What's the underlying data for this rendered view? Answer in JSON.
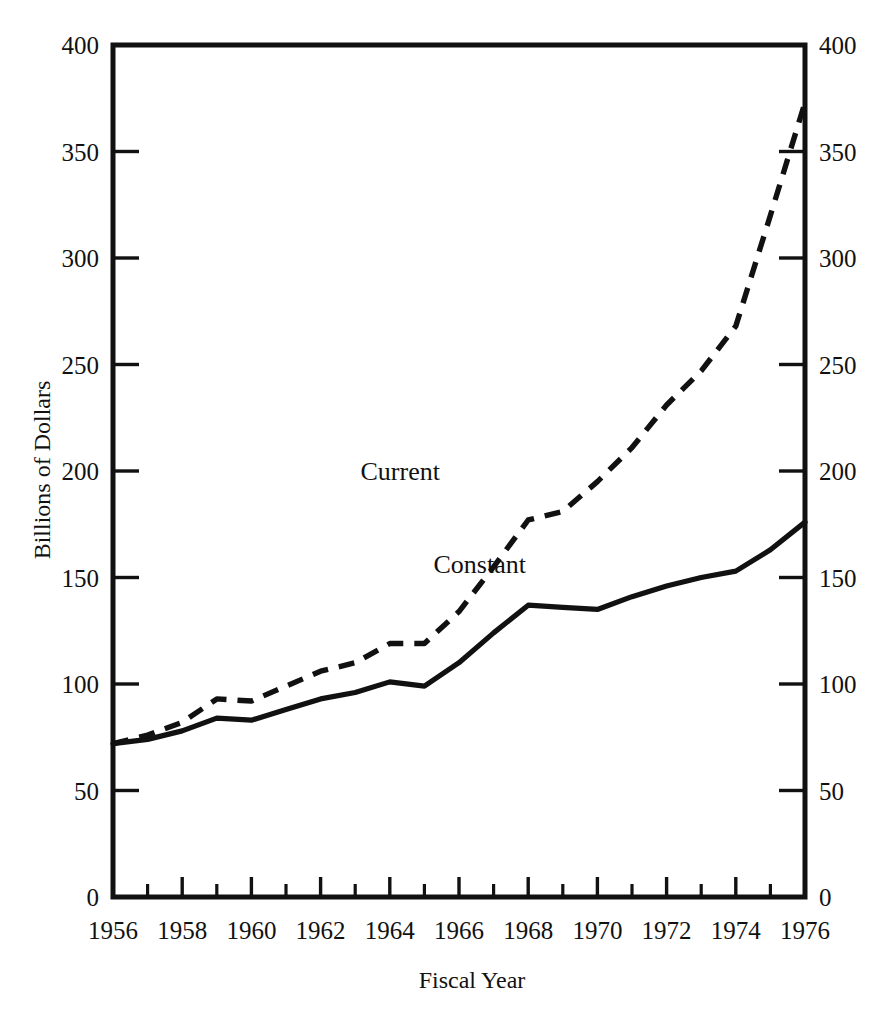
{
  "chart_data": {
    "type": "line",
    "title": "",
    "xlabel": "Fiscal Year",
    "ylabel": "Billions of Dollars",
    "xlim": [
      1956,
      1976
    ],
    "ylim": [
      0,
      400
    ],
    "grid": false,
    "legend": "inline-labels",
    "x_tick_labels": [
      "1956",
      "1958",
      "1960",
      "1962",
      "1964",
      "1966",
      "1968",
      "1970",
      "1972",
      "1974",
      "1976"
    ],
    "x_tick_values": [
      1956,
      1958,
      1960,
      1962,
      1964,
      1966,
      1968,
      1970,
      1972,
      1974,
      1976
    ],
    "x_minor_ticks": [
      1957,
      1959,
      1961,
      1963,
      1965,
      1967,
      1969,
      1971,
      1973,
      1975
    ],
    "y_tick_labels_left": [
      "0",
      "50",
      "100",
      "150",
      "200",
      "250",
      "300",
      "350",
      "400"
    ],
    "y_tick_labels_right": [
      "0",
      "50",
      "100",
      "150",
      "200",
      "250",
      "300",
      "350",
      "400"
    ],
    "y_tick_values": [
      0,
      50,
      100,
      150,
      200,
      250,
      300,
      350,
      400
    ],
    "x": [
      1956,
      1957,
      1958,
      1959,
      1960,
      1961,
      1962,
      1963,
      1964,
      1965,
      1966,
      1967,
      1968,
      1969,
      1970,
      1971,
      1972,
      1973,
      1974,
      1975,
      1976
    ],
    "series": [
      {
        "name": "Current",
        "style": "dashed",
        "label_text": "Current",
        "values": [
          72,
          76,
          82,
          93,
          92,
          99,
          106,
          110,
          119,
          119,
          134,
          155,
          177,
          181,
          195,
          211,
          231,
          247,
          268,
          320,
          373
        ]
      },
      {
        "name": "Constant",
        "style": "solid",
        "label_text": "Constant",
        "values": [
          72,
          74,
          78,
          84,
          83,
          88,
          93,
          96,
          101,
          99,
          110,
          124,
          137,
          136,
          135,
          141,
          146,
          150,
          153,
          163,
          176
        ]
      }
    ],
    "annotations": [
      {
        "text": "Current",
        "x": 1964.3,
        "y": 196
      },
      {
        "text": "Constant",
        "x": 1966.6,
        "y": 152
      }
    ]
  },
  "colors": {
    "ink": "#111111",
    "background": "#ffffff"
  }
}
